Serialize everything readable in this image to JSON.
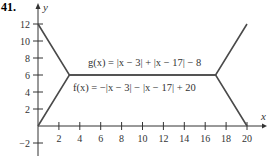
{
  "problem_number": "41.",
  "chart_data": {
    "type": "line",
    "title": "",
    "xlabel": "x",
    "ylabel": "y",
    "xlim": [
      0,
      20
    ],
    "ylim": [
      -2,
      12
    ],
    "x_ticks": [
      2,
      4,
      6,
      8,
      10,
      12,
      14,
      16,
      18,
      20
    ],
    "y_ticks": [
      -2,
      2,
      4,
      6,
      8,
      10,
      12
    ],
    "grid": false,
    "series": [
      {
        "name": "g(x) = |x − 3| + |x − 17| − 8",
        "x": [
          0,
          3,
          17,
          20
        ],
        "y": [
          12,
          6,
          6,
          12
        ]
      },
      {
        "name": "f(x) = −|x − 3| − |x − 17| + 20",
        "x": [
          0,
          3,
          17,
          20
        ],
        "y": [
          0,
          6,
          6,
          0
        ]
      }
    ],
    "annotations": [
      "g(x) = |x − 3| + |x − 17| − 8",
      "f(x) = −|x − 3| − |x − 17| + 20"
    ]
  },
  "labels": {
    "g_label": "g(x) = |x − 3| + |x − 17| − 8",
    "f_label": "f(x) = −|x − 3| − |x − 17| + 20",
    "x_axis": "x",
    "y_axis": "y"
  },
  "colors": {
    "line": "#4a4a4a",
    "axis": "#333333"
  }
}
